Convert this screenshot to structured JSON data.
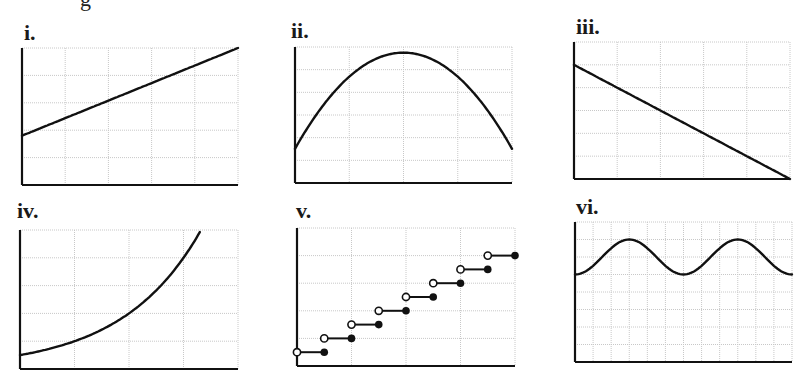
{
  "header_fragment": "g",
  "chart_data": [
    {
      "label": "i.",
      "type": "line",
      "description": "linear increasing",
      "grid": {
        "cols": 5,
        "rows": 5
      },
      "box": {
        "x": 22,
        "y": 48,
        "w": 216,
        "h": 137
      },
      "points": [
        [
          0,
          1.8
        ],
        [
          5,
          5
        ]
      ],
      "xlim": [
        0,
        5
      ],
      "ylim": [
        0,
        5
      ]
    },
    {
      "label": "ii.",
      "type": "line",
      "description": "downward parabola (quadratic, maximum at center)",
      "grid": {
        "cols": 4,
        "rows": 6
      },
      "box": {
        "x": 295,
        "y": 47,
        "w": 217,
        "h": 136
      },
      "points": [
        [
          0,
          1.5
        ],
        [
          1,
          4.6
        ],
        [
          2,
          5.7
        ],
        [
          3,
          4.6
        ],
        [
          4,
          1.6
        ]
      ],
      "xlim": [
        0,
        4
      ],
      "ylim": [
        0,
        6
      ]
    },
    {
      "label": "iii.",
      "type": "line",
      "description": "linear decreasing",
      "grid": {
        "cols": 5,
        "rows": 6
      },
      "box": {
        "x": 574,
        "y": 42,
        "w": 216,
        "h": 137
      },
      "points": [
        [
          0,
          5
        ],
        [
          5,
          0
        ]
      ],
      "xlim": [
        0,
        5
      ],
      "ylim": [
        0,
        6
      ]
    },
    {
      "label": "iv.",
      "type": "line",
      "description": "exponential growth",
      "grid": {
        "cols": 4,
        "rows": 5
      },
      "box": {
        "x": 20,
        "y": 230,
        "w": 218,
        "h": 139
      },
      "points": [
        [
          0,
          0.5
        ],
        [
          1,
          1.0
        ],
        [
          2,
          2.0
        ],
        [
          3,
          4.0
        ],
        [
          3.3,
          5
        ]
      ],
      "xlim": [
        0,
        4
      ],
      "ylim": [
        0,
        5
      ]
    },
    {
      "label": "v.",
      "type": "step",
      "description": "step function, open circle at left end, closed circle at right end of each step",
      "grid": {
        "cols": 4,
        "rows": 5
      },
      "box": {
        "x": 297,
        "y": 228,
        "w": 218,
        "h": 138
      },
      "steps": [
        {
          "x_open": 0.0,
          "x_closed": 0.5,
          "y": 0.5
        },
        {
          "x_open": 0.5,
          "x_closed": 1.0,
          "y": 1.0
        },
        {
          "x_open": 1.0,
          "x_closed": 1.5,
          "y": 1.5
        },
        {
          "x_open": 1.5,
          "x_closed": 2.0,
          "y": 2.0
        },
        {
          "x_open": 2.0,
          "x_closed": 2.5,
          "y": 2.5
        },
        {
          "x_open": 2.5,
          "x_closed": 3.0,
          "y": 3.0
        },
        {
          "x_open": 3.0,
          "x_closed": 3.5,
          "y": 3.5
        },
        {
          "x_open": 3.5,
          "x_closed": 4.0,
          "y": 4.0
        }
      ],
      "xlim": [
        0,
        4
      ],
      "ylim": [
        0,
        5
      ]
    },
    {
      "label": "vi.",
      "type": "line",
      "description": "periodic sinusoid in upper portion of grid",
      "grid": {
        "cols": 12,
        "rows": 8
      },
      "box": {
        "x": 575,
        "y": 222,
        "w": 217,
        "h": 140
      },
      "points": [
        [
          0,
          5
        ],
        [
          1,
          5.4
        ],
        [
          3,
          7
        ],
        [
          5,
          5
        ],
        [
          6,
          5.4
        ],
        [
          9,
          7
        ],
        [
          11,
          5.2
        ],
        [
          12,
          5
        ]
      ],
      "xlim": [
        0,
        12
      ],
      "ylim": [
        0,
        8
      ],
      "period": 6,
      "amplitude": 1,
      "midline": 6
    }
  ]
}
